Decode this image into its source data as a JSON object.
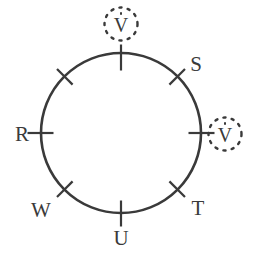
{
  "figure": {
    "kind": "circle-diagram",
    "background_color": "#ffffff",
    "stroke_color": "#3a3a3a",
    "circle": {
      "cx": 121,
      "cy": 133,
      "r": 80,
      "stroke_width": 2.6
    },
    "tick": {
      "length": 17,
      "stroke_width": 2.2,
      "count": 8,
      "spacing_degrees": 45
    }
  },
  "nodes": [
    {
      "id": "top-tick",
      "label": "",
      "angle_deg": 270,
      "label_x": 0,
      "label_y": 0
    },
    {
      "id": "s-node",
      "label": "S",
      "angle_deg": 315,
      "label_x": 196,
      "label_y": 64
    },
    {
      "id": "r-node",
      "label": "R",
      "angle_deg": 180,
      "label_x": 22,
      "label_y": 134
    },
    {
      "id": "t-node",
      "label": "T",
      "angle_deg": 45,
      "label_x": 198,
      "label_y": 208
    },
    {
      "id": "u-node",
      "label": "U",
      "angle_deg": 90,
      "label_x": 121,
      "label_y": 238
    },
    {
      "id": "w-node",
      "label": "W",
      "angle_deg": 135,
      "label_x": 41,
      "label_y": 210
    },
    {
      "id": "nw-tick",
      "label": "",
      "angle_deg": 225,
      "label_x": 0,
      "label_y": 0
    },
    {
      "id": "east-tick",
      "label": "",
      "angle_deg": 0,
      "label_x": 0,
      "label_y": 0
    }
  ],
  "labels": {
    "r": "R",
    "s": "S",
    "t": "T",
    "u": "U",
    "w": "W"
  },
  "vector_markers": [
    {
      "id": "v-top",
      "glyph": "V",
      "accent": "dot-above",
      "x": 121,
      "y": 24,
      "ring_style": "dashed"
    },
    {
      "id": "v-right",
      "glyph": "V",
      "accent": "dot-above",
      "x": 225,
      "y": 134,
      "ring_style": "dashed"
    }
  ],
  "vector_glyph": "V"
}
